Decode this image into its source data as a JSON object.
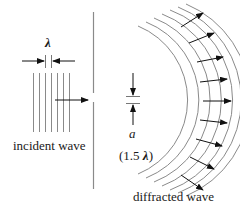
{
  "diagram": {
    "labels": {
      "wavelength_symbol": "λ",
      "incident_wave": "incident wave",
      "aperture_symbol": "a",
      "aperture_size_prefix": "(1.5 ",
      "aperture_size_lambda": "λ",
      "aperture_size_suffix": ")",
      "diffracted_wave": "diffracted wave"
    },
    "colors": {
      "wavefront_line": "#8a8a8a",
      "barrier": "#8a8a8a",
      "arrow": "#111111",
      "text": "#1a1a1a",
      "background": "#ffffff"
    },
    "incident_wavefronts": {
      "count": 7,
      "orientation": "vertical"
    },
    "diffracted_wavefronts": {
      "count": 7,
      "shape": "circular-arc"
    },
    "propagation_arrows": {
      "count": 9
    }
  }
}
